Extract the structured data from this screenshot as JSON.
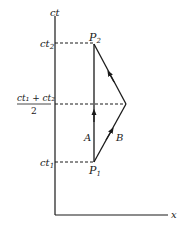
{
  "diagram": {
    "type": "spacetime-diagram",
    "axes": {
      "vertical_label": "ct",
      "horizontal_label": "x"
    },
    "tick_labels": {
      "ct2": {
        "main": "ct",
        "sub": "2"
      },
      "ct1": {
        "main": "ct",
        "sub": "1"
      },
      "mid_numerator": "ct₁ + ct₂",
      "mid_denominator": "2"
    },
    "points": {
      "P2": {
        "main": "P",
        "sub": "2"
      },
      "P1": {
        "main": "P",
        "sub": "1"
      }
    },
    "paths": {
      "A": "A",
      "B": "B"
    },
    "colors": {
      "ink": "#1a1a1a",
      "background": "#ffffff"
    }
  }
}
